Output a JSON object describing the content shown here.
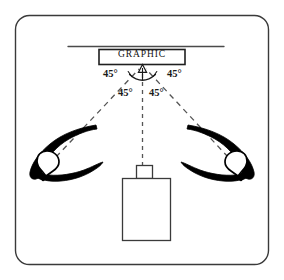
{
  "figure": {
    "frame": {
      "name": "rounded-border-frame",
      "stroke": "#3a3a3a",
      "radius": 14
    },
    "colors": {
      "ink": "#1a1a1a",
      "line": "#3a3a3a",
      "dashed": "#555555",
      "lamp_fill": "#000000",
      "background": "#ffffff"
    }
  },
  "wall": {
    "name": "wall-line",
    "label": ""
  },
  "graphic": {
    "label": "GRAPHIC",
    "box_name": "graphic-artwork-box"
  },
  "angles": {
    "top_left": "45°",
    "top_right": "45°",
    "mid_left": "45°",
    "mid_right": "45°"
  },
  "lamps": [
    {
      "name": "lamp-left",
      "label": ""
    },
    {
      "name": "lamp-right",
      "label": ""
    }
  ],
  "camera": {
    "name": "camera-body",
    "lens_name": "camera-lens",
    "label": ""
  },
  "rays": [
    {
      "name": "light-ray-left",
      "from": "lamp-left",
      "to": "graphic"
    },
    {
      "name": "light-ray-right",
      "from": "lamp-right",
      "to": "graphic"
    },
    {
      "name": "camera-axis",
      "from": "camera",
      "to": "graphic"
    }
  ]
}
